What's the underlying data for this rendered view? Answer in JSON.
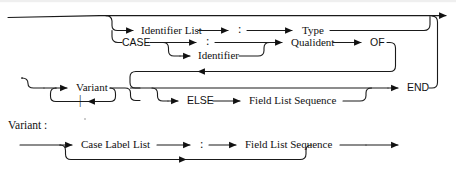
{
  "page": {
    "background_color": "#ffffff",
    "line_color": "#1a1a1a",
    "text_color": "#111111",
    "width": 456,
    "height": 180
  },
  "diagrams": [
    {
      "id": "field-list",
      "rule_label": "",
      "nodes": {
        "identifier_list": "Identifier List",
        "colon_1": ":",
        "type": "Type",
        "case": "CASE",
        "colon_2": ":",
        "identifier": "Identifier",
        "qualident": "Qualident",
        "of": "OF",
        "variant": "Variant",
        "alternation_bar": "|",
        "else": "ELSE",
        "field_list_sequence": "Field List Sequence",
        "end": "END"
      }
    },
    {
      "id": "variant",
      "rule_label": "Variant :",
      "nodes": {
        "case_label_list": "Case Label List",
        "colon": ":",
        "field_list_sequence": "Field List Sequence"
      }
    }
  ],
  "icons": {
    "arrow": "arrow-right-icon",
    "arrow_left": "arrow-left-icon"
  }
}
